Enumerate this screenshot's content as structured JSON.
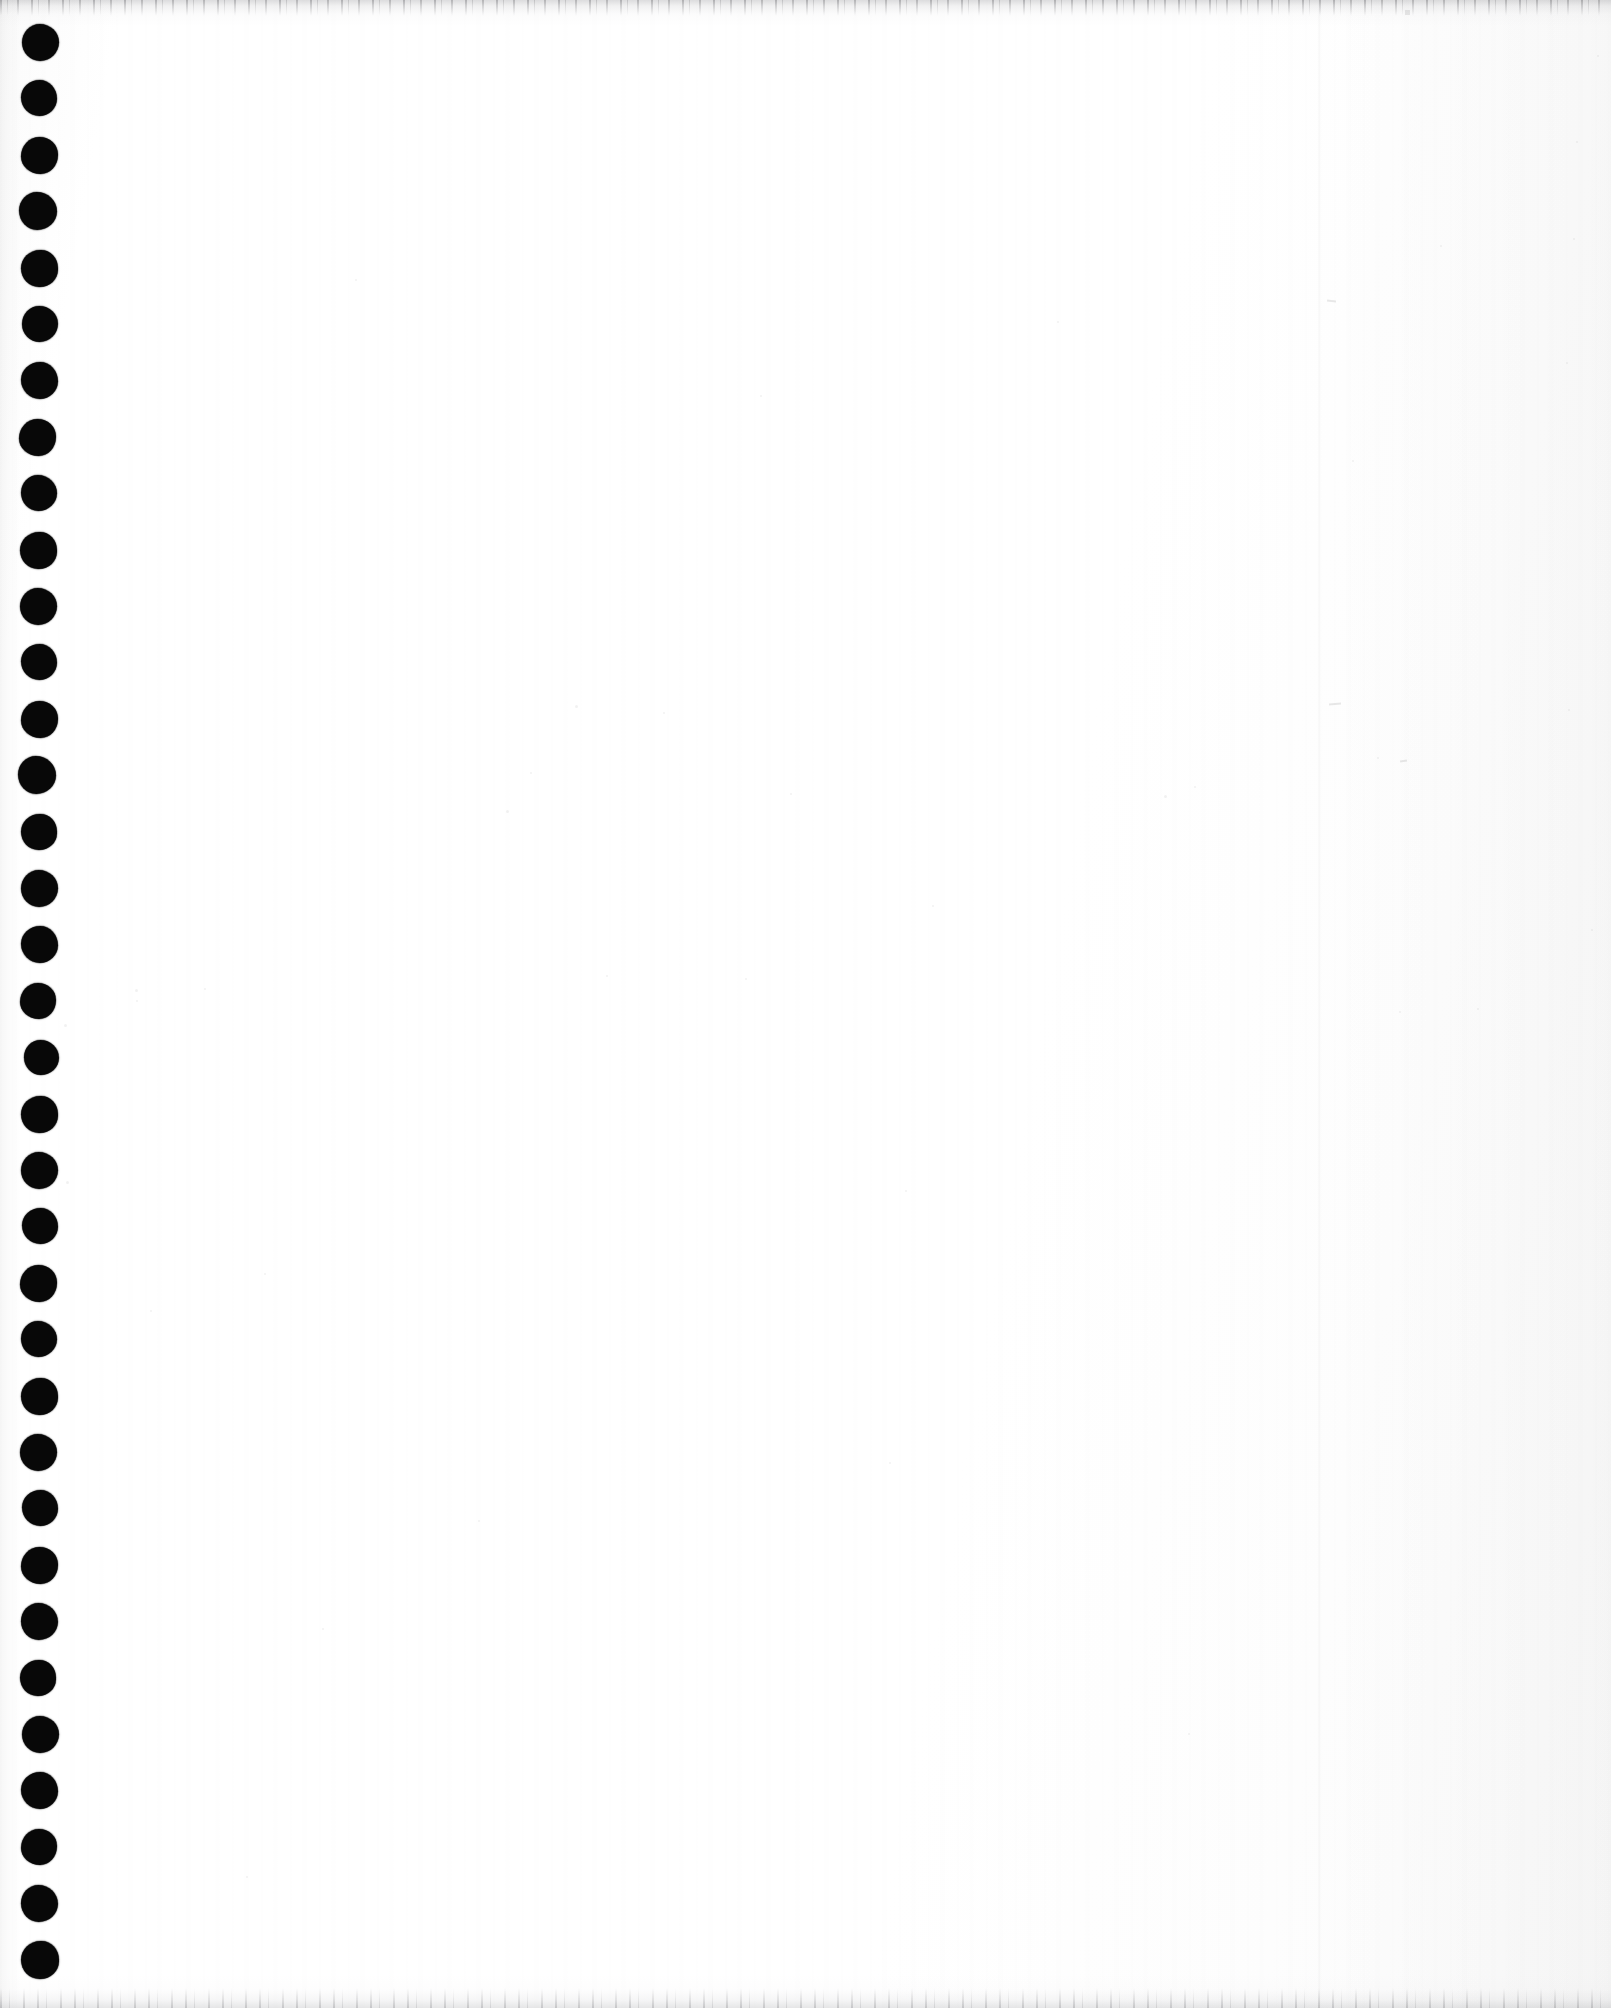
{
  "document": {
    "kind": "scanned-page",
    "description": "Blank scanned page from a spiral / twin-loop bound notebook",
    "surface_label": "",
    "page_text": "",
    "canvas": {
      "width_px": 1611,
      "height_px": 2008
    }
  },
  "colors": {
    "paper": "#ffffff",
    "paper_tint": "#fbfbfb",
    "hole_ink": "#080808",
    "edge_shadow": "#78787d",
    "page_edge_line": "#000000"
  },
  "binding": {
    "name": "spiral-binding-holes",
    "side": "left",
    "hole_count": 35,
    "first_center_y": 42,
    "spacing_y": 56.4,
    "center_x": 39,
    "diameter": 37,
    "holes": [
      {
        "cx": 40,
        "cy": 42,
        "d": 37
      },
      {
        "cx": 39,
        "cy": 98,
        "d": 36
      },
      {
        "cx": 39,
        "cy": 155,
        "d": 37
      },
      {
        "cx": 38,
        "cy": 211,
        "d": 38
      },
      {
        "cx": 39,
        "cy": 268,
        "d": 37
      },
      {
        "cx": 40,
        "cy": 324,
        "d": 36
      },
      {
        "cx": 39,
        "cy": 380,
        "d": 37
      },
      {
        "cx": 37,
        "cy": 437,
        "d": 37
      },
      {
        "cx": 39,
        "cy": 493,
        "d": 36
      },
      {
        "cx": 38,
        "cy": 550,
        "d": 37
      },
      {
        "cx": 38,
        "cy": 606,
        "d": 37
      },
      {
        "cx": 39,
        "cy": 662,
        "d": 36
      },
      {
        "cx": 39,
        "cy": 719,
        "d": 37
      },
      {
        "cx": 37,
        "cy": 775,
        "d": 38
      },
      {
        "cx": 39,
        "cy": 832,
        "d": 36
      },
      {
        "cx": 39,
        "cy": 888,
        "d": 37
      },
      {
        "cx": 39,
        "cy": 944,
        "d": 37
      },
      {
        "cx": 38,
        "cy": 1001,
        "d": 36
      },
      {
        "cx": 41,
        "cy": 1057,
        "d": 35
      },
      {
        "cx": 39,
        "cy": 1114,
        "d": 37
      },
      {
        "cx": 39,
        "cy": 1170,
        "d": 37
      },
      {
        "cx": 40,
        "cy": 1226,
        "d": 36
      },
      {
        "cx": 38,
        "cy": 1283,
        "d": 37
      },
      {
        "cx": 39,
        "cy": 1339,
        "d": 36
      },
      {
        "cx": 39,
        "cy": 1396,
        "d": 37
      },
      {
        "cx": 38,
        "cy": 1452,
        "d": 37
      },
      {
        "cx": 40,
        "cy": 1508,
        "d": 36
      },
      {
        "cx": 39,
        "cy": 1565,
        "d": 37
      },
      {
        "cx": 39,
        "cy": 1621,
        "d": 37
      },
      {
        "cx": 38,
        "cy": 1678,
        "d": 36
      },
      {
        "cx": 40,
        "cy": 1734,
        "d": 37
      },
      {
        "cx": 39,
        "cy": 1790,
        "d": 37
      },
      {
        "cx": 39,
        "cy": 1847,
        "d": 36
      },
      {
        "cx": 39,
        "cy": 1903,
        "d": 37
      },
      {
        "cx": 40,
        "cy": 1960,
        "d": 38
      }
    ]
  },
  "page_edge": {
    "name": "page-edge-line",
    "x": 1318,
    "visible": true
  },
  "scan_artifacts": {
    "top_band_height": 26,
    "bottom_band_height": 34,
    "left_margin_shade_width": 22,
    "specks": [
      {
        "x": 575,
        "y": 705,
        "d": 3
      },
      {
        "x": 663,
        "y": 712,
        "d": 2
      },
      {
        "x": 506,
        "y": 810,
        "d": 3
      },
      {
        "x": 790,
        "y": 793,
        "d": 2
      },
      {
        "x": 530,
        "y": 772,
        "d": 2
      },
      {
        "x": 1164,
        "y": 795,
        "d": 3
      },
      {
        "x": 1194,
        "y": 786,
        "d": 2
      },
      {
        "x": 932,
        "y": 905,
        "d": 2
      },
      {
        "x": 606,
        "y": 975,
        "d": 2
      },
      {
        "x": 745,
        "y": 978,
        "d": 2
      },
      {
        "x": 135,
        "y": 989,
        "d": 3
      },
      {
        "x": 64,
        "y": 1024,
        "d": 3
      },
      {
        "x": 204,
        "y": 988,
        "d": 2
      },
      {
        "x": 136,
        "y": 1000,
        "d": 2
      },
      {
        "x": 1399,
        "y": 1011,
        "d": 2
      },
      {
        "x": 1477,
        "y": 1008,
        "d": 2
      },
      {
        "x": 66,
        "y": 1181,
        "d": 3
      },
      {
        "x": 264,
        "y": 1273,
        "d": 2
      },
      {
        "x": 150,
        "y": 1310,
        "d": 2
      },
      {
        "x": 1377,
        "y": 757,
        "d": 2
      },
      {
        "x": 1440,
        "y": 245,
        "d": 2
      },
      {
        "x": 1352,
        "y": 460,
        "d": 2
      },
      {
        "x": 1576,
        "y": 141,
        "d": 2
      },
      {
        "x": 1573,
        "y": 238,
        "d": 2
      },
      {
        "x": 1566,
        "y": 362,
        "d": 2
      },
      {
        "x": 1597,
        "y": 55,
        "d": 2
      },
      {
        "x": 1568,
        "y": 709,
        "d": 2
      },
      {
        "x": 1591,
        "y": 929,
        "d": 2
      },
      {
        "x": 478,
        "y": 1520,
        "d": 2
      },
      {
        "x": 322,
        "y": 1628,
        "d": 2
      },
      {
        "x": 889,
        "y": 1462,
        "d": 2
      },
      {
        "x": 1188,
        "y": 1733,
        "d": 2
      },
      {
        "x": 246,
        "y": 1876,
        "d": 2
      },
      {
        "x": 760,
        "y": 395,
        "d": 2
      },
      {
        "x": 355,
        "y": 279,
        "d": 2
      },
      {
        "x": 1057,
        "y": 321,
        "d": 2
      },
      {
        "x": 905,
        "y": 1190,
        "d": 2
      }
    ],
    "dust_marks": [
      {
        "x": 1329,
        "y": 703,
        "w": 12,
        "h": 2,
        "rot": -4
      },
      {
        "x": 1327,
        "y": 300,
        "w": 9,
        "h": 2,
        "rot": 6
      },
      {
        "x": 1405,
        "y": 10,
        "w": 5,
        "h": 5,
        "rot": 0
      },
      {
        "x": 1400,
        "y": 760,
        "w": 7,
        "h": 2,
        "rot": -8
      }
    ]
  }
}
